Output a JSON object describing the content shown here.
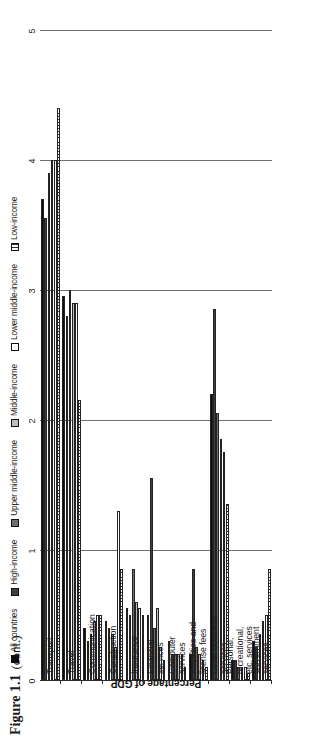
{
  "figure": {
    "number": "Figure 1.1",
    "continuation": "(cont.)"
  },
  "chart_data": {
    "type": "bar",
    "orientation": "horizontal-rotated",
    "xlabel": "",
    "ylabel": "Percentage of GDP",
    "ylim": [
      0,
      5
    ],
    "yticks": [
      "0",
      "1",
      "2",
      "3",
      "4",
      "5"
    ],
    "grid": true,
    "legend_position": "top",
    "categories": [
      "Transport",
      "Travel",
      "Communication",
      "Construction",
      "Insurance",
      "Financial\nservices",
      "Computer\nservices",
      "Royalties and\nlicense fees",
      "Other business\nservices",
      "Personal,\nrecreational,\netc. services",
      "Government\nservices"
    ],
    "series": [
      {
        "name": "All countries",
        "color": "#0d0d0d",
        "fill": "solid-black",
        "values": [
          3.7,
          2.95,
          0.4,
          0.45,
          0.55,
          0.5,
          0.3,
          0.2,
          2.2,
          0.15,
          0.3
        ]
      },
      {
        "name": "High-income",
        "color": "#3f3f3f",
        "fill": "dark-gray",
        "values": [
          3.55,
          2.8,
          0.3,
          0.4,
          0.5,
          1.55,
          0.2,
          0.85,
          2.85,
          0.15,
          0.25
        ]
      },
      {
        "name": "Upper middle-income",
        "color": "#6e6e6e",
        "fill": "mid-gray",
        "values": [
          3.9,
          3.0,
          0.35,
          0.35,
          0.85,
          0.4,
          0.2,
          0.25,
          2.05,
          0.1,
          0.35
        ]
      },
      {
        "name": "Middle-income",
        "color": "#bdbdbd",
        "fill": "light-gray",
        "values": [
          4.0,
          2.9,
          0.45,
          0.25,
          0.6,
          0.55,
          0.2,
          0.2,
          1.85,
          0.1,
          0.45
        ]
      },
      {
        "name": "Lower middle-income",
        "color": "#ffffff",
        "fill": "white",
        "values": [
          4.0,
          2.9,
          0.5,
          1.3,
          0.55,
          0.25,
          0.2,
          0.15,
          1.75,
          0.1,
          0.5
        ]
      },
      {
        "name": "Low-income",
        "color": "#ffffff",
        "fill": "hatched",
        "values": [
          4.4,
          2.15,
          0.5,
          0.85,
          0.5,
          0.15,
          0.1,
          0.1,
          1.35,
          0.05,
          0.85
        ]
      }
    ]
  }
}
